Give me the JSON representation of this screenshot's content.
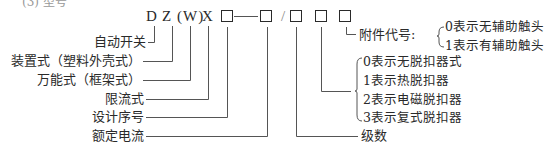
{
  "heading": "(3) 型号",
  "code": {
    "prefix_D": "D",
    "prefix_Z": "Z",
    "w": "(W)",
    "x": "X",
    "slash": "/"
  },
  "left_labels": [
    {
      "id": "D",
      "text": "自动开关"
    },
    {
      "id": "Z",
      "text": "装置式（塑料外壳式）"
    },
    {
      "id": "W",
      "text": "万能式（框架式）"
    },
    {
      "id": "X",
      "text": "限流式"
    },
    {
      "id": "box1",
      "text": "设计序号"
    },
    {
      "id": "box2",
      "text": "额定电流"
    }
  ],
  "accessory": {
    "label": "附件代号:",
    "options": [
      "0表示无辅助触头",
      "1表示有辅助触头"
    ]
  },
  "release": {
    "options": [
      "0表示无脱扣器式",
      "1表示热脱扣器",
      "2表示电磁脱扣器",
      "3表示复式脱扣器"
    ]
  },
  "poles": {
    "label": "级数"
  },
  "colors": {
    "ink": "#2a2a2a",
    "line": "#555555",
    "background": "#ffffff"
  }
}
